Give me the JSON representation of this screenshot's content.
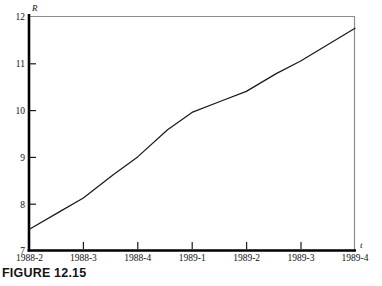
{
  "figure": {
    "caption": "FIGURE 12.15"
  },
  "chart_data": {
    "type": "line",
    "title": "",
    "xlabel": "t",
    "ylabel": "R",
    "grid": false,
    "legend": "none",
    "xlim": [
      0,
      6
    ],
    "ylim": [
      7,
      12
    ],
    "yticks": [
      7,
      8,
      9,
      10,
      11,
      12
    ],
    "ytick_labels": [
      "7",
      "8",
      "9",
      "10",
      "11",
      "12"
    ],
    "categories": [
      "1988-2",
      "1988-3",
      "1988-4",
      "1989-1",
      "1989-2",
      "1989-3",
      "1989-4"
    ],
    "x": [
      0,
      1,
      2,
      3,
      4,
      5,
      6
    ],
    "values": [
      7.45,
      8.12,
      9.0,
      9.95,
      10.4,
      11.05,
      11.75
    ],
    "series": [
      {
        "name": "R",
        "color": "#1a1a1a",
        "values": [
          7.45,
          8.12,
          9.0,
          9.95,
          10.4,
          11.05,
          11.75
        ]
      }
    ],
    "vertices": [
      {
        "x": 0.0,
        "y": 7.45
      },
      {
        "x": 0.55,
        "y": 7.82
      },
      {
        "x": 1.0,
        "y": 8.12
      },
      {
        "x": 1.55,
        "y": 8.62
      },
      {
        "x": 2.0,
        "y": 9.0
      },
      {
        "x": 2.55,
        "y": 9.58
      },
      {
        "x": 3.0,
        "y": 9.95
      },
      {
        "x": 3.55,
        "y": 10.2
      },
      {
        "x": 4.0,
        "y": 10.4
      },
      {
        "x": 4.55,
        "y": 10.78
      },
      {
        "x": 5.0,
        "y": 11.05
      },
      {
        "x": 6.0,
        "y": 11.75
      }
    ],
    "colors": {
      "line": "#1a1a1a",
      "axis": "#000000",
      "frame": "#8d8d8d",
      "background": "#ffffff",
      "text": "#111111"
    }
  }
}
